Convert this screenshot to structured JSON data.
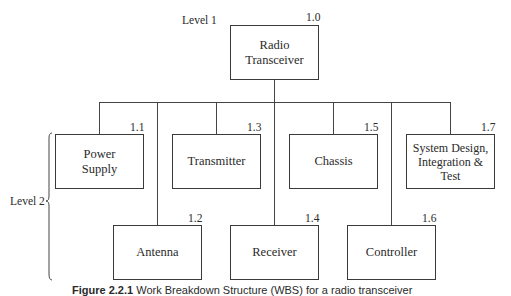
{
  "diagram": {
    "type": "work-breakdown-structure",
    "levels": {
      "level1_label": "Level 1",
      "level2_label": "Level 2"
    },
    "root": {
      "id": "1.0",
      "label": "Radio\nTransceiver"
    },
    "children": [
      {
        "id": "1.1",
        "label": "Power\nSupply"
      },
      {
        "id": "1.2",
        "label": "Antenna"
      },
      {
        "id": "1.3",
        "label": "Transmitter"
      },
      {
        "id": "1.4",
        "label": "Receiver"
      },
      {
        "id": "1.5",
        "label": "Chassis"
      },
      {
        "id": "1.6",
        "label": "Controller"
      },
      {
        "id": "1.7",
        "label": "System Design,\nIntegration &\nTest"
      }
    ],
    "caption": {
      "prefix": "Figure 2.2.1",
      "text": " Work Breakdown Structure (WBS) for a radio transceiver"
    }
  }
}
